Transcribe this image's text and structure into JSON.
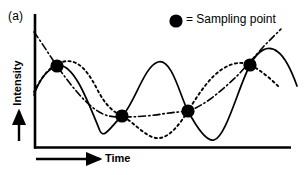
{
  "figure": {
    "panel_label": "(a)",
    "legend": {
      "marker": "filled-circle",
      "text": "= Sampling point"
    },
    "axes": {
      "y_label": "Intensity",
      "x_label": "Time",
      "y_arrow": "up-arrow",
      "x_arrow": "right-arrow"
    },
    "colors": {
      "ink": "#000000",
      "background": "#ffffff"
    }
  },
  "chart_data": {
    "type": "line",
    "title": "",
    "xlabel": "Time",
    "ylabel": "Intensity",
    "grid": false,
    "legend_position": "top-right",
    "axis_pixel_frame": {
      "x_axis_y": 148,
      "y_axis_x": 34,
      "x_axis_end": 291,
      "y_axis_top": 14
    },
    "annotations": [
      "(a)",
      "= Sampling point"
    ],
    "sampling_points": [
      {
        "x": 57,
        "y": 66
      },
      {
        "x": 122,
        "y": 116
      },
      {
        "x": 188,
        "y": 111
      },
      {
        "x": 250,
        "y": 65
      }
    ],
    "series": [
      {
        "name": "high-frequency-signal",
        "style": "solid",
        "path": "M 34,95 C 40,78 48,69 57,66 C 72,61 86,96 100,131 C 104,140 112,125 122,116 C 134,105 144,66 158,62 C 172,58 180,96 188,111 C 196,126 206,142 214,140 C 226,137 238,88 250,65 C 258,50 268,44 278,52 C 286,58 292,72 297,86"
      },
      {
        "name": "aliased-signal-dashed",
        "style": "dashed",
        "path": "M 34,92 C 42,76 50,66 62,62 C 76,58 86,68 96,87 C 106,107 114,112 122,116 C 134,122 144,136 156,138 C 168,140 180,124 188,111 C 198,95 210,76 224,68 C 238,60 246,63 252,66 C 262,71 272,80 280,88"
      },
      {
        "name": "aliased-signal-dashdot",
        "style": "dashdot",
        "path": "M 34,32 C 42,43 50,56 57,66 C 70,84 82,100 96,110 C 106,117 114,117 122,117 C 136,117 150,116 162,114 C 174,112 182,112 188,111 C 204,106 220,92 236,77 C 244,69 254,57 264,46 C 270,40 276,34 281,29"
      }
    ]
  }
}
